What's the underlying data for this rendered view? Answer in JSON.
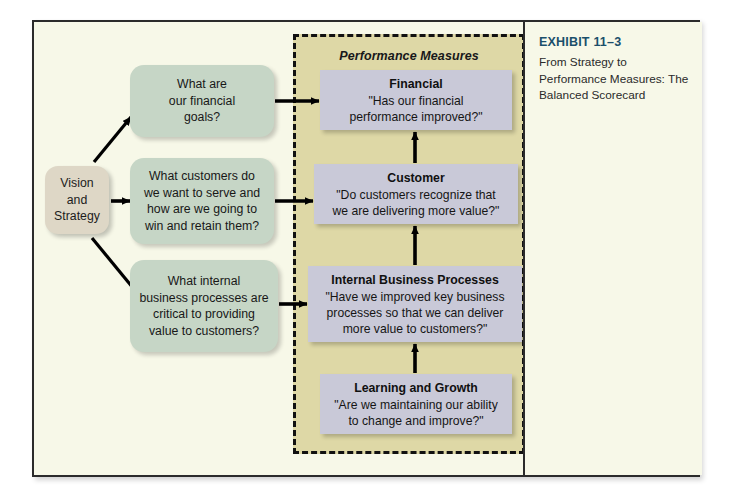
{
  "exhibit": {
    "number": "EXHIBIT 11–3",
    "caption": "From Strategy to Performance Measures: The Balanced Scorecard"
  },
  "panel": {
    "title": "Performance Measures",
    "fill_color": "#ded8a6",
    "border_style": "dashed",
    "border_color": "#111111"
  },
  "vision": {
    "label": "Vision and Strategy",
    "lines": [
      "Vision",
      "and",
      "Strategy"
    ],
    "fill_color": "#ded7c6"
  },
  "questions": [
    {
      "id": "financial-question",
      "lines": [
        "What are",
        "our financial",
        "goals?"
      ],
      "fill_color": "#c6d6c6"
    },
    {
      "id": "customer-question",
      "lines": [
        "What customers do",
        "we want to serve and",
        "how are we going to",
        "win and retain them?"
      ],
      "fill_color": "#c6d6c6"
    },
    {
      "id": "internal-process-question",
      "lines": [
        "What internal",
        "business processes are",
        "critical to providing",
        "value to customers?"
      ],
      "fill_color": "#c6d6c6"
    }
  ],
  "measures": [
    {
      "id": "financial",
      "title": "Financial",
      "quote_lines": [
        "\"Has our financial",
        "performance improved?\""
      ],
      "fill_color": "#c9c9d8"
    },
    {
      "id": "customer",
      "title": "Customer",
      "quote_lines": [
        "\"Do customers recognize that",
        "we are delivering more value?\""
      ],
      "fill_color": "#c9c9d8"
    },
    {
      "id": "internal-business-processes",
      "title": "Internal Business Processes",
      "quote_lines": [
        "\"Have we improved key business",
        "processes so that we can deliver",
        "more value to customers?\""
      ],
      "fill_color": "#c9c9d8"
    },
    {
      "id": "learning-and-growth",
      "title": "Learning and Growth",
      "quote_lines": [
        "\"Are we maintaining our ability",
        "to change and improve?\""
      ],
      "fill_color": "#c9c9d8"
    }
  ],
  "colors": {
    "page_background": "#ffffff",
    "frame_background": "#f7f8e8",
    "frame_border": "#2b2b2b",
    "exhibit_number_color": "#1b4f6b",
    "arrow_color": "#000000"
  }
}
